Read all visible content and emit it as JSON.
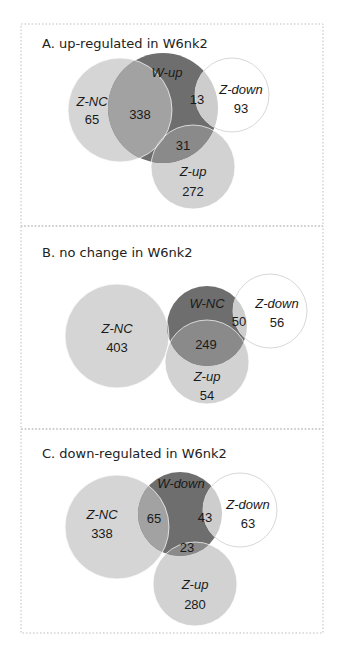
{
  "chart_data": [
    {
      "type": "venn",
      "panel": "A",
      "title": "A. up-regulated in W6nk2",
      "frame": {
        "x": 21,
        "y": 24,
        "w": 302,
        "h": 202
      },
      "title_pos": {
        "x": 42,
        "y": 48
      },
      "sets": {
        "Z-NC": {
          "cx": 120,
          "cy": 110,
          "r": 52
        },
        "W": {
          "name": "W-up",
          "cx": 163,
          "cy": 108,
          "r": 55
        },
        "Z-down": {
          "cx": 232,
          "cy": 95,
          "r": 37
        },
        "Z-up": {
          "cx": 193,
          "cy": 167,
          "r": 42
        }
      },
      "labels": [
        {
          "text": "W-up",
          "x": 167,
          "y": 77,
          "kind": "set"
        },
        {
          "text": "Z-NC",
          "x": 92,
          "y": 106,
          "kind": "set"
        },
        {
          "text": "65",
          "x": 92,
          "y": 124,
          "kind": "count"
        },
        {
          "text": "338",
          "x": 140,
          "y": 119,
          "kind": "count"
        },
        {
          "text": "13",
          "x": 197,
          "y": 104,
          "kind": "count"
        },
        {
          "text": "Z-down",
          "x": 241,
          "y": 94,
          "kind": "set"
        },
        {
          "text": "93",
          "x": 241,
          "y": 113,
          "kind": "count"
        },
        {
          "text": "31",
          "x": 183,
          "y": 150,
          "kind": "count"
        },
        {
          "text": "Z-up",
          "x": 193,
          "y": 176,
          "kind": "set"
        },
        {
          "text": "272",
          "x": 193,
          "y": 196,
          "kind": "count"
        }
      ],
      "regions": {
        "Z-NC only": 65,
        "W-up ∩ Z-NC": 338,
        "W-up ∩ Z-down": 13,
        "Z-down only": 93,
        "W-up ∩ Z-up": 31,
        "Z-up only": 272
      }
    },
    {
      "type": "venn",
      "panel": "B",
      "title": "B. no change in W6nk2",
      "frame": {
        "x": 21,
        "y": 226,
        "w": 302,
        "h": 203
      },
      "title_pos": {
        "x": 42,
        "y": 257
      },
      "sets": {
        "Z-NC": {
          "cx": 117,
          "cy": 336,
          "r": 52
        },
        "W": {
          "name": "W-NC",
          "cx": 207,
          "cy": 326,
          "r": 40
        },
        "Z-down": {
          "cx": 270,
          "cy": 311,
          "r": 37
        },
        "Z-up": {
          "cx": 207,
          "cy": 362,
          "r": 42
        }
      },
      "labels": [
        {
          "text": "W-NC",
          "x": 207,
          "y": 308,
          "kind": "set"
        },
        {
          "text": "Z-NC",
          "x": 117,
          "y": 333,
          "kind": "set"
        },
        {
          "text": "403",
          "x": 117,
          "y": 352,
          "kind": "count"
        },
        {
          "text": "50",
          "x": 239,
          "y": 326,
          "kind": "count"
        },
        {
          "text": "Z-down",
          "x": 277,
          "y": 308,
          "kind": "set"
        },
        {
          "text": "56",
          "x": 277,
          "y": 327,
          "kind": "count"
        },
        {
          "text": "249",
          "x": 206,
          "y": 349,
          "kind": "count"
        },
        {
          "text": "Z-up",
          "x": 207,
          "y": 381,
          "kind": "set"
        },
        {
          "text": "54",
          "x": 207,
          "y": 400,
          "kind": "count"
        }
      ],
      "regions": {
        "Z-NC only": 403,
        "W-NC ∩ Z-down": 50,
        "Z-down only": 56,
        "W-NC ∩ Z-up": 249,
        "Z-up only": 54
      }
    },
    {
      "type": "venn",
      "panel": "C",
      "title": "C. down-regulated in W6nk2",
      "frame": {
        "x": 21,
        "y": 429,
        "w": 302,
        "h": 204
      },
      "title_pos": {
        "x": 42,
        "y": 458
      },
      "sets": {
        "Z-NC": {
          "cx": 117,
          "cy": 527,
          "r": 52
        },
        "W": {
          "name": "W-down",
          "cx": 180,
          "cy": 514,
          "r": 42
        },
        "Z-down": {
          "cx": 240,
          "cy": 510,
          "r": 37
        },
        "Z-up": {
          "cx": 195,
          "cy": 584,
          "r": 42
        }
      },
      "labels": [
        {
          "text": "W-down",
          "x": 181,
          "y": 488,
          "kind": "set"
        },
        {
          "text": "Z-NC",
          "x": 102,
          "y": 519,
          "kind": "set"
        },
        {
          "text": "338",
          "x": 102,
          "y": 538,
          "kind": "count"
        },
        {
          "text": "65",
          "x": 154,
          "y": 523,
          "kind": "count"
        },
        {
          "text": "43",
          "x": 205,
          "y": 522,
          "kind": "count"
        },
        {
          "text": "Z-down",
          "x": 248,
          "y": 509,
          "kind": "set"
        },
        {
          "text": "63",
          "x": 248,
          "y": 528,
          "kind": "count"
        },
        {
          "text": "23",
          "x": 187,
          "y": 552,
          "kind": "count"
        },
        {
          "text": "Z-up",
          "x": 195,
          "y": 589,
          "kind": "set"
        },
        {
          "text": "280",
          "x": 195,
          "y": 609,
          "kind": "count"
        }
      ],
      "regions": {
        "Z-NC only": 338,
        "W-down ∩ Z-NC": 65,
        "W-down ∩ Z-down": 43,
        "Z-down only": 63,
        "W-down ∩ Z-up": 23,
        "Z-up only": 280
      }
    }
  ],
  "colors": {
    "z_nc": "#d5d5d5",
    "z_up": "#d2d2d2",
    "w": "#6e6e6e",
    "w_and_znc": "#a2a2a2",
    "w_and_zup": "#8a8a8a",
    "w_and_zdown": "#cdcdcd",
    "z_down_fill": "#ffffff",
    "z_down_stroke": "#d8d8d8",
    "frame": "#bdbdbd"
  }
}
